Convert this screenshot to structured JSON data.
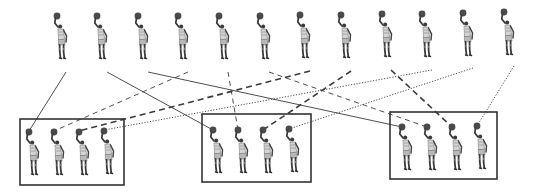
{
  "diagram": {
    "colors": {
      "line": "#3a3a3a",
      "box": "#333333",
      "figure_dark": "#3c3c3c",
      "figure_mid": "#8a8a8a",
      "figure_light": "#cfcfcf"
    },
    "top_row": {
      "count": 12,
      "figures": [
        {
          "id": "t1",
          "x": 57,
          "y": 16
        },
        {
          "id": "t2",
          "x": 97,
          "y": 16
        },
        {
          "id": "t3",
          "x": 138,
          "y": 16
        },
        {
          "id": "t4",
          "x": 178,
          "y": 16
        },
        {
          "id": "t5",
          "x": 219,
          "y": 16
        },
        {
          "id": "t6",
          "x": 260,
          "y": 16
        },
        {
          "id": "t7",
          "x": 300,
          "y": 15
        },
        {
          "id": "t8",
          "x": 341,
          "y": 15
        },
        {
          "id": "t9",
          "x": 382,
          "y": 14
        },
        {
          "id": "t10",
          "x": 422,
          "y": 14
        },
        {
          "id": "t11",
          "x": 463,
          "y": 13
        },
        {
          "id": "t12",
          "x": 504,
          "y": 12
        }
      ]
    },
    "groups": [
      {
        "id": "box1",
        "x": 20,
        "y": 119,
        "w": 104,
        "h": 66,
        "figures": [
          {
            "x": 29,
            "y": 132
          },
          {
            "x": 54,
            "y": 132
          },
          {
            "x": 79,
            "y": 132
          },
          {
            "x": 104,
            "y": 131
          }
        ]
      },
      {
        "id": "box2",
        "x": 202,
        "y": 114,
        "w": 109,
        "h": 68,
        "figures": [
          {
            "x": 213,
            "y": 130
          },
          {
            "x": 238,
            "y": 130
          },
          {
            "x": 263,
            "y": 130
          },
          {
            "x": 289,
            "y": 129
          }
        ]
      },
      {
        "id": "box3",
        "x": 390,
        "y": 112,
        "w": 107,
        "h": 67,
        "figures": [
          {
            "x": 402,
            "y": 127
          },
          {
            "x": 427,
            "y": 127
          },
          {
            "x": 452,
            "y": 127
          },
          {
            "x": 477,
            "y": 126
          }
        ]
      }
    ],
    "connections": [
      {
        "from": "t1",
        "to": "box1.0",
        "style": "solid"
      },
      {
        "from": "t2",
        "to": "box2.0",
        "style": "solid"
      },
      {
        "from": "t3",
        "to": "box3.0",
        "style": "solid"
      },
      {
        "from": "t4",
        "to": "box1.1",
        "style": "thin-dashed"
      },
      {
        "from": "t5",
        "to": "box2.1",
        "style": "thin-dashed"
      },
      {
        "from": "t6",
        "to": "box3.1",
        "style": "thin-dashed"
      },
      {
        "from": "t7",
        "to": "box1.2",
        "style": "thick-dashed"
      },
      {
        "from": "t8",
        "to": "box2.2",
        "style": "thick-dashed"
      },
      {
        "from": "t9",
        "to": "box3.2",
        "style": "thick-dashed"
      },
      {
        "from": "t10",
        "to": "box1.3",
        "style": "dotted"
      },
      {
        "from": "t11",
        "to": "box2.3",
        "style": "dotted"
      },
      {
        "from": "t12",
        "to": "box3.3",
        "style": "dotted"
      }
    ]
  }
}
